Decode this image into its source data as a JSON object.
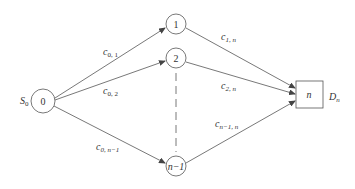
{
  "diagram": {
    "type": "flow-network",
    "source": {
      "id": "0",
      "label": "S",
      "label_sub": "0"
    },
    "sink": {
      "id": "n",
      "label": "D",
      "label_sub": "n",
      "shape": "square"
    },
    "intermediate_nodes": [
      {
        "id": "1",
        "label": "1"
      },
      {
        "id": "2",
        "label": "2"
      },
      {
        "id": "n-1",
        "label": "n−1"
      }
    ],
    "edges": [
      {
        "from": "0",
        "to": "1",
        "label": "c",
        "label_sub": "0, 1"
      },
      {
        "from": "0",
        "to": "2",
        "label": "c",
        "label_sub": "0, 2"
      },
      {
        "from": "0",
        "to": "n-1",
        "label": "c",
        "label_sub": "0, n−1"
      },
      {
        "from": "1",
        "to": "n",
        "label": "c",
        "label_sub": "1, n"
      },
      {
        "from": "2",
        "to": "n",
        "label": "c",
        "label_sub": "2, n"
      },
      {
        "from": "n-1",
        "to": "n",
        "label": "c",
        "label_sub": "n−1, n"
      }
    ],
    "ellipsis": {
      "from": "2",
      "to": "n-1",
      "style": "dashed"
    },
    "colors": {
      "stroke": "#555555",
      "text": "#333333",
      "background": "#ffffff"
    }
  }
}
